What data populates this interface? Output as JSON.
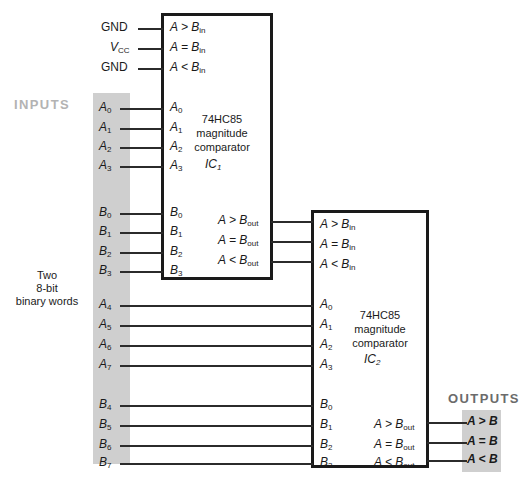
{
  "figure": {
    "colors": {
      "band_gray": "#cfcfcf",
      "wire": "#2b2b2b",
      "chip_border": "#1a1a1a",
      "inputs_label": "#b3b3b3",
      "outputs_label": "#6b6b6b"
    }
  },
  "labels": {
    "inputs": "INPUTS",
    "outputs": "OUTPUTS",
    "description_line1": "Two",
    "description_line2": "8-bit",
    "description_line3": "binary words"
  },
  "supply_inputs": [
    {
      "name": "gnd-top",
      "text": "GND",
      "pin": "A > B",
      "pin_sub": "in"
    },
    {
      "name": "vcc",
      "text": "V",
      "text_sub": "CC",
      "pin": "A = B",
      "pin_sub": "in"
    },
    {
      "name": "gnd-bottom",
      "text": "GND",
      "pin": "A < B",
      "pin_sub": "in"
    }
  ],
  "ic1": {
    "name": "74HC85",
    "line1": "74HC85",
    "line2": "magnitude",
    "line3": "comparator",
    "designator": "IC",
    "designator_sub": "1",
    "cascade_inputs": [
      {
        "label": "A > B",
        "sub": "in"
      },
      {
        "label": "A = B",
        "sub": "in"
      },
      {
        "label": "A < B",
        "sub": "in"
      }
    ],
    "a_inputs": [
      {
        "label": "A",
        "sub": "0"
      },
      {
        "label": "A",
        "sub": "1"
      },
      {
        "label": "A",
        "sub": "2"
      },
      {
        "label": "A",
        "sub": "3"
      }
    ],
    "b_inputs": [
      {
        "label": "B",
        "sub": "0"
      },
      {
        "label": "B",
        "sub": "1"
      },
      {
        "label": "B",
        "sub": "2"
      },
      {
        "label": "B",
        "sub": "3"
      }
    ],
    "outputs": [
      {
        "label": "A > B",
        "sub": "out"
      },
      {
        "label": "A = B",
        "sub": "out"
      },
      {
        "label": "A < B",
        "sub": "out"
      }
    ]
  },
  "ic2": {
    "name": "74HC85",
    "line1": "74HC85",
    "line2": "magnitude",
    "line3": "comparator",
    "designator": "IC",
    "designator_sub": "2",
    "cascade_inputs": [
      {
        "label": "A > B",
        "sub": "in"
      },
      {
        "label": "A = B",
        "sub": "in"
      },
      {
        "label": "A < B",
        "sub": "in"
      }
    ],
    "a_inputs": [
      {
        "label": "A",
        "sub": "0"
      },
      {
        "label": "A",
        "sub": "1"
      },
      {
        "label": "A",
        "sub": "2"
      },
      {
        "label": "A",
        "sub": "3"
      }
    ],
    "b_inputs": [
      {
        "label": "B",
        "sub": "0"
      },
      {
        "label": "B",
        "sub": "1"
      },
      {
        "label": "B",
        "sub": "2"
      },
      {
        "label": "B",
        "sub": "3"
      }
    ],
    "outputs": [
      {
        "label": "A > B",
        "sub": "out"
      },
      {
        "label": "A = B",
        "sub": "out"
      },
      {
        "label": "A < B",
        "sub": "out"
      }
    ]
  },
  "bus_signals": {
    "group_a_low": [
      {
        "label": "A",
        "sub": "0"
      },
      {
        "label": "A",
        "sub": "1"
      },
      {
        "label": "A",
        "sub": "2"
      },
      {
        "label": "A",
        "sub": "3"
      }
    ],
    "group_b_low": [
      {
        "label": "B",
        "sub": "0"
      },
      {
        "label": "B",
        "sub": "1"
      },
      {
        "label": "B",
        "sub": "2"
      },
      {
        "label": "B",
        "sub": "3"
      }
    ],
    "group_a_high": [
      {
        "label": "A",
        "sub": "4"
      },
      {
        "label": "A",
        "sub": "5"
      },
      {
        "label": "A",
        "sub": "6"
      },
      {
        "label": "A",
        "sub": "7"
      }
    ],
    "group_b_high": [
      {
        "label": "B",
        "sub": "4"
      },
      {
        "label": "B",
        "sub": "5"
      },
      {
        "label": "B",
        "sub": "6"
      },
      {
        "label": "B",
        "sub": "7"
      }
    ]
  },
  "final_outputs": [
    {
      "label": "A > B"
    },
    {
      "label": "A = B"
    },
    {
      "label": "A < B"
    }
  ]
}
